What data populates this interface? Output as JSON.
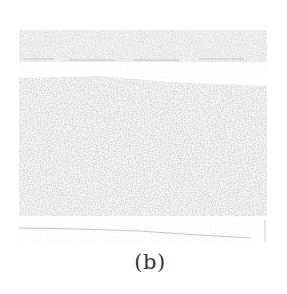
{
  "figure": {
    "caption": "(b)",
    "image": {
      "description": "grayscale noisy texture panel",
      "layers": [
        {
          "name": "top-band",
          "color": "#c9c9c9"
        },
        {
          "name": "gap",
          "color": "#f4f4f4"
        },
        {
          "name": "main-texture",
          "color": "#d2d2d2"
        },
        {
          "name": "bottom-streak",
          "color": "#bdbdbd"
        }
      ]
    }
  }
}
